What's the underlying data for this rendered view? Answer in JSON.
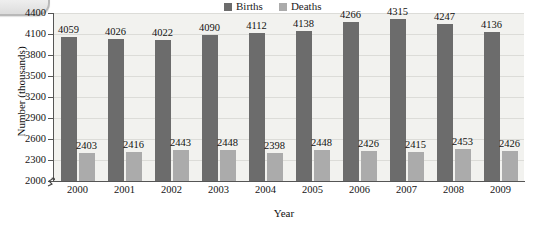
{
  "artifact": {
    "name": "page-tab-artifact"
  },
  "legend": {
    "position": "top-center",
    "entries": [
      {
        "label": "Births",
        "color": "#6c6c6c"
      },
      {
        "label": "Deaths",
        "color": "#ababab"
      }
    ]
  },
  "axes": {
    "ylabel": "Number (thousands)",
    "xlabel": "Year",
    "yticks": [
      "2000",
      "2300",
      "2600",
      "2900",
      "3200",
      "3500",
      "3800",
      "4100",
      "4400"
    ],
    "ybreak": true
  },
  "chart_data": {
    "type": "bar",
    "title": "",
    "xlabel": "Year",
    "ylabel": "Number (thousands)",
    "categories": [
      "2000",
      "2001",
      "2002",
      "2003",
      "2004",
      "2005",
      "2006",
      "2007",
      "2008",
      "2009"
    ],
    "series": [
      {
        "name": "Births",
        "color": "#6c6c6c",
        "values": [
          4059,
          4026,
          4022,
          4090,
          4112,
          4138,
          4266,
          4315,
          4247,
          4136
        ]
      },
      {
        "name": "Deaths",
        "color": "#ababab",
        "values": [
          2403,
          2416,
          2443,
          2448,
          2398,
          2448,
          2426,
          2415,
          2453,
          2426
        ]
      }
    ],
    "ylim": [
      2000,
      4400
    ],
    "ytick_step": 300,
    "grid": true,
    "legend_position": "top-center",
    "axis_break": "y-axis broken below 2000"
  }
}
